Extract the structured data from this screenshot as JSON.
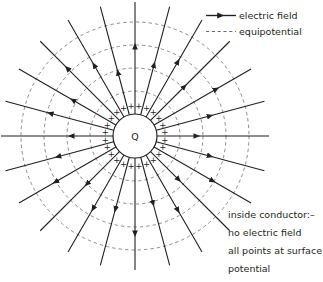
{
  "figure": {
    "width": 323,
    "height": 282
  },
  "legend": {
    "items": [
      {
        "key": "electric-field",
        "label": "electric field",
        "style": "solid-arrow",
        "color": "#231f20"
      },
      {
        "key": "equipotential",
        "label": "equipotential",
        "style": "dashed",
        "color": "#6d6e71"
      }
    ]
  },
  "notes": {
    "lines": [
      "inside conductor:–",
      "no electric field",
      "all points at surface",
      "potential"
    ]
  },
  "conductor": {
    "label": "Q",
    "surface_charge_symbol": "+",
    "center_x": 135,
    "center_y": 136,
    "radius": 22,
    "stroke": "#231f20",
    "fill": "#ffffff"
  },
  "chart_data": {
    "type": "scatter",
    "xlabel": "",
    "ylabel": "",
    "center": [
      135,
      136
    ],
    "field_lines": {
      "count": 24,
      "angle_step_deg": 15,
      "angles_deg": [
        0,
        15,
        30,
        45,
        60,
        75,
        90,
        105,
        120,
        135,
        150,
        165,
        180,
        195,
        210,
        225,
        240,
        255,
        270,
        285,
        300,
        315,
        330,
        345
      ],
      "inner_radius": 22,
      "outer_radius": 134,
      "direction": "outward",
      "arrowhead_radii": [
        62,
        78,
        94,
        70,
        86,
        74,
        90,
        66,
        82,
        96,
        72,
        88,
        64,
        80,
        92,
        68,
        84,
        76,
        98,
        70,
        86,
        62,
        90,
        78
      ],
      "color": "#231f20",
      "stroke_width": 1.1
    },
    "equipotentials": {
      "count": 4,
      "radii": [
        45,
        68,
        91,
        114
      ],
      "style": "dashed",
      "color": "#6d6e71",
      "stroke_width": 0.8
    },
    "surface_charges": {
      "count": 24,
      "radius": 30,
      "symbol": "+",
      "color": "#231f20"
    },
    "legend_position": "top-right",
    "grid": false
  }
}
